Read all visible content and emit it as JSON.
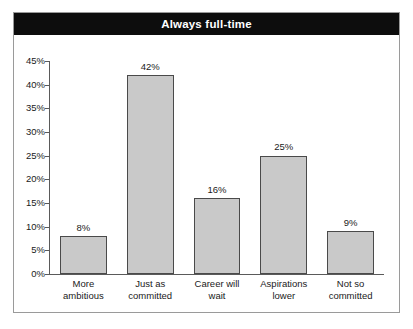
{
  "figure": {
    "title": "Always full-time",
    "title_bg_color": "#0d0d0d",
    "title_text_color": "#ffffff",
    "frame_border_color": "#9a9a9a",
    "background_color": "#ffffff"
  },
  "chart_data": {
    "type": "bar",
    "title": "Always full-time",
    "xlabel": "",
    "ylabel": "",
    "categories": [
      "More ambitious",
      "Just as committed",
      "Career will wait",
      "Aspirations lower",
      "Not so committed"
    ],
    "category_lines": [
      [
        "More",
        "ambitious"
      ],
      [
        "Just as",
        "committed"
      ],
      [
        "Career will",
        "wait"
      ],
      [
        "Aspirations",
        "lower"
      ],
      [
        "Not so",
        "committed"
      ]
    ],
    "values": [
      8,
      42,
      16,
      25,
      9
    ],
    "data_labels": [
      "8%",
      "42%",
      "16%",
      "25%",
      "9%"
    ],
    "ylim": [
      0,
      45
    ],
    "ytick_values": [
      0,
      5,
      10,
      15,
      20,
      25,
      30,
      35,
      40,
      45
    ],
    "ytick_labels": [
      "0%",
      "5%",
      "10%",
      "15%",
      "20%",
      "25%",
      "30%",
      "35%",
      "40%",
      "45%"
    ],
    "grid": false,
    "legend": false,
    "bar_fill_color": "#c9c9c9",
    "bar_edge_color": "#4a4a4a",
    "axis_color": "#5a5a5a"
  }
}
